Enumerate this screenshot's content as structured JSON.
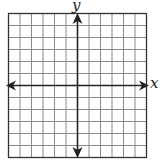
{
  "diagram": {
    "type": "coordinate-grid",
    "x_axis_label": "x",
    "y_axis_label": "y",
    "grid": {
      "columns": 12,
      "rows": 12
    },
    "colors": {
      "grid": "#8a8a8a",
      "border": "#333333",
      "axes": "#222222"
    }
  }
}
